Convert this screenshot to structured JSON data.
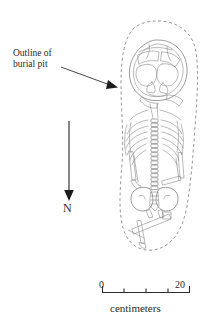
{
  "figure": {
    "type": "archaeological-burial-plan"
  },
  "callout": {
    "name": "burial-pit-callout",
    "line1": "Outline of",
    "line2": "burial pit",
    "arrow_from": [
      62,
      68
    ],
    "arrow_to": [
      116,
      88
    ],
    "points_to": "dashed pit outline"
  },
  "north_arrow": {
    "label": "N",
    "direction": "down",
    "line_from": [
      69,
      122
    ],
    "line_to": [
      69,
      198
    ]
  },
  "scale_bar": {
    "min_label": "0",
    "max_label": "20",
    "units_label": "centimeters",
    "segments": 4,
    "bar_left": 102,
    "bar_right": 190,
    "bar_y": 292
  },
  "skeleton": {
    "elements": [
      "cranium",
      "mandible",
      "clavicles",
      "ribcage",
      "vertebral-column",
      "pelvis",
      "sacrum",
      "humerus",
      "radius-ulna",
      "femur",
      "tibia-fibula"
    ],
    "orientation": "head at top, feet at bottom",
    "vertebra_count": 17
  },
  "colors": {
    "background": "#ffffff",
    "bone_line": "#7b7b7b",
    "pit_outline": "#8d8d8d",
    "text": "#2b2b2b",
    "arrow": "#1c1c1c"
  }
}
